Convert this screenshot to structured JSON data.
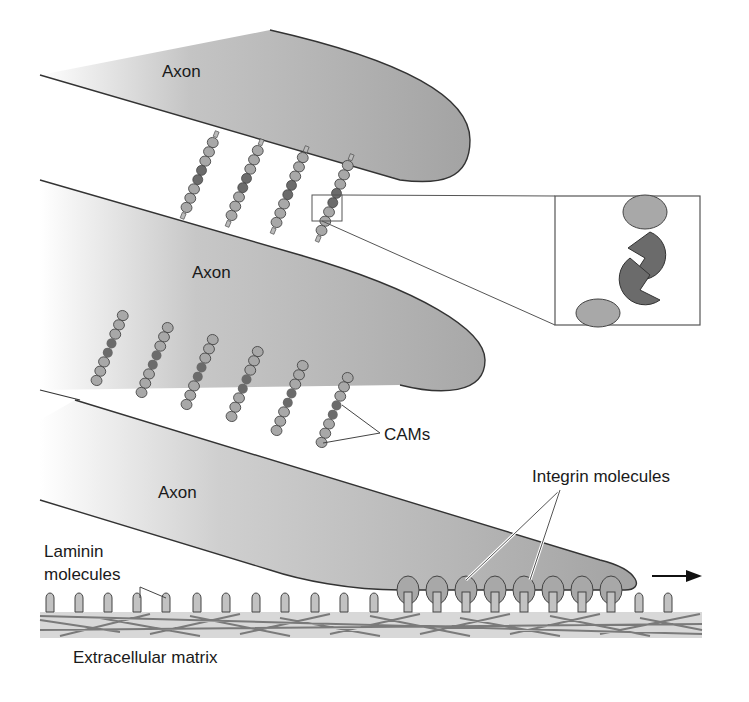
{
  "figure": {
    "labels": {
      "axon_top": "Axon",
      "axon_middle": "Axon",
      "axon_bottom": "Axon",
      "cams": "CAMs",
      "integrin": "Integrin molecules",
      "laminin_line1": "Laminin",
      "laminin_line2": "molecules",
      "ecm": "Extracellular matrix"
    },
    "colors": {
      "axon_fill": "#a9a9a9",
      "bead_fill": "#a6a6a6",
      "bead_dark": "#6b6b6b",
      "outline": "#333333",
      "matrix_fibers": "#7a7a7a",
      "matrix_bg": "#d8d8d8"
    },
    "direction_arrow": "right"
  }
}
